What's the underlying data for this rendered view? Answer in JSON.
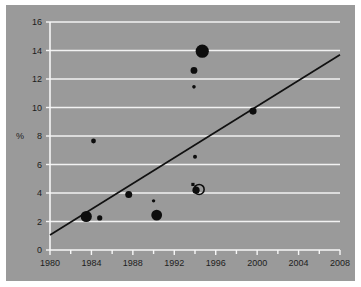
{
  "chart_data": {
    "type": "scatter",
    "title": "",
    "subtitle": "",
    "xlabel": "",
    "ylabel": "%",
    "xlim": [
      1980,
      2008
    ],
    "ylim": [
      0,
      16
    ],
    "grid": true,
    "legend": "none",
    "background_color": "#9a9a9a",
    "gridline_color": "#f2f2f2",
    "marker_color": "#0d0d0d",
    "trendline_color": "#111111",
    "x_ticks": [
      1980,
      1984,
      1988,
      1992,
      1996,
      2000,
      2004,
      2008
    ],
    "x_tick_labels": [
      "1980",
      "1984",
      "1988",
      "1992",
      "1996",
      "2000",
      "2004",
      "2008"
    ],
    "x_minor_ticks": [
      1982,
      1986,
      1990,
      1994,
      1998,
      2002,
      2006
    ],
    "y_ticks": [
      0,
      2,
      4,
      6,
      8,
      10,
      12,
      14,
      16
    ],
    "y_tick_labels": [
      "0",
      "2",
      "4",
      "6",
      "8",
      "10",
      "12",
      "14",
      "16"
    ],
    "points": [
      {
        "x": 1983.5,
        "y": 2.35,
        "size": 5.6,
        "marker": "filled-circle"
      },
      {
        "x": 1984.2,
        "y": 7.65,
        "size": 2.4,
        "marker": "filled-circle"
      },
      {
        "x": 1984.8,
        "y": 2.25,
        "size": 2.6,
        "marker": "filled-circle"
      },
      {
        "x": 1987.6,
        "y": 3.9,
        "size": 3.5,
        "marker": "filled-circle"
      },
      {
        "x": 1990.0,
        "y": 3.45,
        "size": 1.7,
        "marker": "filled-circle"
      },
      {
        "x": 1990.3,
        "y": 2.45,
        "size": 5.4,
        "marker": "filled-circle"
      },
      {
        "x": 1993.9,
        "y": 11.45,
        "size": 1.8,
        "marker": "filled-circle"
      },
      {
        "x": 1993.9,
        "y": 12.6,
        "size": 3.4,
        "marker": "filled-circle"
      },
      {
        "x": 1994.0,
        "y": 6.55,
        "size": 2.0,
        "marker": "filled-circle"
      },
      {
        "x": 1993.8,
        "y": 4.6,
        "size": 1.6,
        "marker": "filled-square"
      },
      {
        "x": 1994.1,
        "y": 4.2,
        "size": 3.6,
        "marker": "filled-circle"
      },
      {
        "x": 1994.4,
        "y": 4.25,
        "size": 5.0,
        "marker": "ring"
      },
      {
        "x": 1994.7,
        "y": 13.95,
        "size": 6.6,
        "marker": "filled-circle"
      },
      {
        "x": 1999.6,
        "y": 9.75,
        "size": 3.6,
        "marker": "filled-circle"
      }
    ],
    "trendline": {
      "x1": 1980.0,
      "y1": 1.05,
      "x2": 2008.0,
      "y2": 13.7
    }
  }
}
